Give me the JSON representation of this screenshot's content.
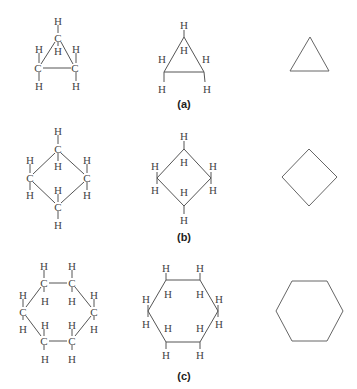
{
  "figure": {
    "rows": [
      {
        "label": "(a)",
        "molecule": "cyclopropane",
        "ring_size": 3,
        "carbon_symbol": "C",
        "hydrogen_symbol": "H"
      },
      {
        "label": "(b)",
        "molecule": "cyclobutane",
        "ring_size": 4,
        "carbon_symbol": "C",
        "hydrogen_symbol": "H"
      },
      {
        "label": "(c)",
        "molecule": "cyclohexane",
        "ring_size": 6,
        "carbon_symbol": "C",
        "hydrogen_symbol": "H"
      }
    ],
    "columns": [
      "full structural formula",
      "condensed line structure with H",
      "skeletal formula"
    ],
    "colors": {
      "line": "#555555",
      "text": "#444444",
      "background": "#ffffff"
    }
  }
}
